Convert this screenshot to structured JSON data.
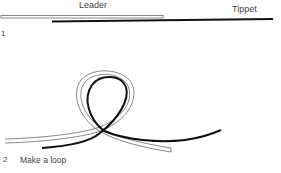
{
  "diagram": {
    "labels": {
      "leader": "Leader",
      "tippet": "Tippet"
    },
    "steps": [
      {
        "number": "1",
        "caption": ""
      },
      {
        "number": "2",
        "caption": "Make a loop"
      }
    ],
    "colors": {
      "leader_line": "#555555",
      "tippet_line": "#111111",
      "background": "#ffffff"
    }
  }
}
